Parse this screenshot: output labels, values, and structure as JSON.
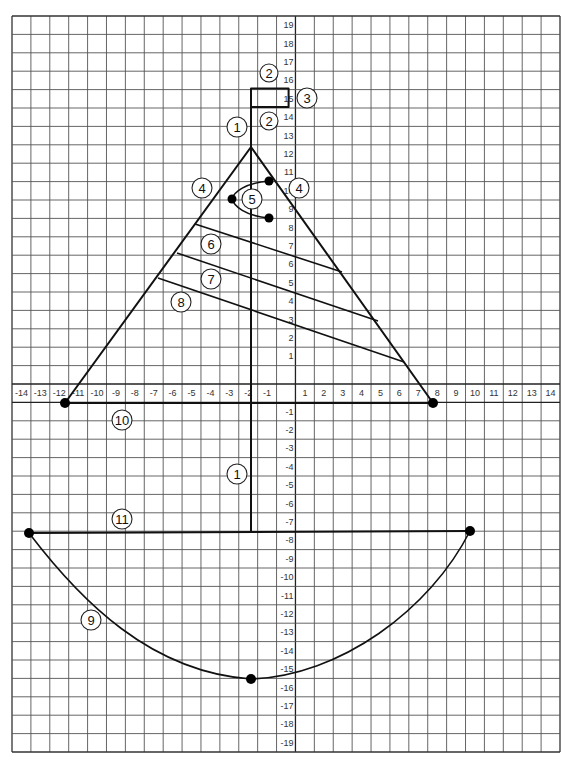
{
  "figure": {
    "grid": {
      "x_labels_negative": [
        "-14",
        "-13",
        "-12",
        "-11",
        "-10",
        "-9",
        "-8",
        "-7",
        "-6",
        "-5",
        "-4",
        "-3",
        "-2",
        "-1"
      ],
      "x_labels_positive": [
        "1",
        "2",
        "3",
        "4",
        "5",
        "6",
        "7",
        "8",
        "9",
        "10",
        "11",
        "12",
        "13",
        "14"
      ],
      "y_labels_positive": [
        "19",
        "18",
        "17",
        "16",
        "15",
        "14",
        "13",
        "12",
        "11",
        "10",
        "9",
        "8",
        "7",
        "6",
        "5",
        "4",
        "3",
        "2",
        "1"
      ],
      "y_labels_negative": [
        "-1",
        "-2",
        "-3",
        "-4",
        "-5",
        "-6",
        "-7",
        "-8",
        "-9",
        "-10",
        "-11",
        "-12",
        "-13",
        "-14",
        "-15",
        "-16",
        "-17",
        "-18",
        "-19"
      ]
    },
    "callouts": [
      {
        "id": "2-top",
        "text": "2",
        "part": "flag top edge"
      },
      {
        "id": "3",
        "text": "3",
        "part": "flag"
      },
      {
        "id": "2-bottom",
        "text": "2",
        "part": "flag bottom edge"
      },
      {
        "id": "1-top",
        "text": "1",
        "part": "mast (top)"
      },
      {
        "id": "4-left",
        "text": "4",
        "part": "sail left edge"
      },
      {
        "id": "4-right",
        "text": "4",
        "part": "sail right edge"
      },
      {
        "id": "5",
        "text": "5",
        "part": "curve in sail"
      },
      {
        "id": "6",
        "text": "6",
        "part": "sail stripe 1"
      },
      {
        "id": "7",
        "text": "7",
        "part": "sail stripe 2"
      },
      {
        "id": "8",
        "text": "8",
        "part": "sail stripe 3"
      },
      {
        "id": "10",
        "text": "10",
        "part": "boom / sail base"
      },
      {
        "id": "1-bottom",
        "text": "1",
        "part": "mast (lower)"
      },
      {
        "id": "11",
        "text": "11",
        "part": "deck line"
      },
      {
        "id": "9",
        "text": "9",
        "part": "hull curve"
      }
    ]
  }
}
